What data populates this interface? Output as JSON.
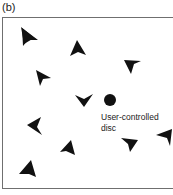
{
  "panel": {
    "label": "(b)"
  },
  "disc": {
    "label_line1": "User-controlled",
    "label_line2": "disc",
    "cx": 110,
    "cy": 100,
    "r": 6,
    "color": "#111111"
  },
  "arrowheads": {
    "color": "#111111",
    "count": 11,
    "items": [
      {
        "id": 1,
        "x": 28,
        "y": 37,
        "pointing": "up-left"
      },
      {
        "id": 2,
        "x": 76,
        "y": 47,
        "pointing": "up"
      },
      {
        "id": 3,
        "x": 131,
        "y": 66,
        "pointing": "down-left"
      },
      {
        "id": 4,
        "x": 41,
        "y": 77,
        "pointing": "up-left"
      },
      {
        "id": 5,
        "x": 83,
        "y": 100,
        "pointing": "down"
      },
      {
        "id": 6,
        "x": 35,
        "y": 126,
        "pointing": "down-right"
      },
      {
        "id": 7,
        "x": 70,
        "y": 148,
        "pointing": "up"
      },
      {
        "id": 8,
        "x": 129,
        "y": 143,
        "pointing": "down-right"
      },
      {
        "id": 9,
        "x": 164,
        "y": 136,
        "pointing": "down-left"
      },
      {
        "id": 10,
        "x": 29,
        "y": 167,
        "pointing": "up"
      }
    ]
  }
}
